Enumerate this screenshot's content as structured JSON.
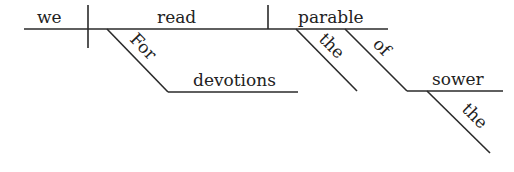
{
  "diagram": {
    "type": "sentence-diagram",
    "sentence": "For devotions we read the parable of the sower.",
    "subject": "we",
    "verb": "read",
    "object": "parable",
    "modifiers": {
      "verb_preposition": "For",
      "verb_prep_object": "devotions",
      "object_article": "the",
      "object_preposition": "of",
      "object_prep_object": "sower",
      "prep_object_article": "the"
    }
  }
}
